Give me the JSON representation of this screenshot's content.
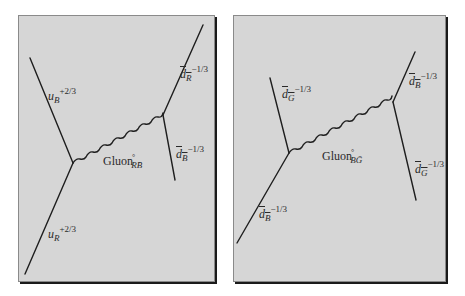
{
  "panels": [
    {
      "id": "left",
      "gluon": {
        "name": "Gluon",
        "degree": "°",
        "subscript": "RB̄"
      },
      "particles": {
        "upper_left": {
          "symbol": "u",
          "subscript": "B",
          "charge": "+2/3"
        },
        "lower_left": {
          "symbol": "u",
          "subscript": "R",
          "charge": "+2/3"
        },
        "upper_right": {
          "symbol": "d",
          "subscript": "R",
          "charge": "−1/3"
        },
        "lower_right": {
          "symbol": "d",
          "subscript": "B",
          "charge": "−1/3"
        }
      }
    },
    {
      "id": "right",
      "gluon": {
        "name": "Gluon",
        "degree": "°",
        "subscript": "BḠ"
      },
      "particles": {
        "upper_left": {
          "symbol": "d",
          "subscript": "G",
          "charge": "−1/3"
        },
        "lower_left": {
          "symbol": "d",
          "subscript": "B",
          "charge": "−1/3"
        },
        "upper_right": {
          "symbol": "d",
          "subscript": "B",
          "charge": "−1/3"
        },
        "lower_right": {
          "symbol": "d",
          "subscript": "G",
          "charge": "−1/3"
        }
      }
    }
  ],
  "colors": {
    "panel_bg": "#d6d6d6",
    "line": "#1e1e1e",
    "shadow": "#1a1a1a"
  }
}
